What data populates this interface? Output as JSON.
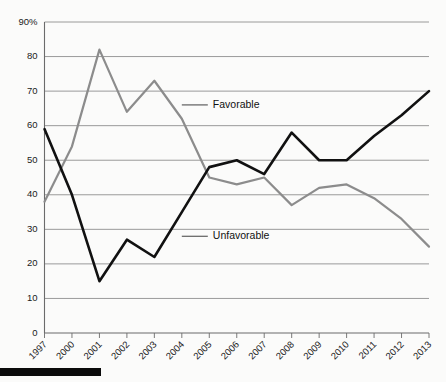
{
  "chart_data": {
    "type": "line",
    "title": "",
    "subtitle": "",
    "xlabel": "",
    "ylabel": "",
    "categories": [
      "1997",
      "2000",
      "2001",
      "2002",
      "2003",
      "2004",
      "2005",
      "2006",
      "2007",
      "2008",
      "2009",
      "2010",
      "2011",
      "2012",
      "2013"
    ],
    "series": [
      {
        "name": "Favorable",
        "color": "#8c8c8c",
        "values": [
          38,
          54,
          82,
          64,
          73,
          62,
          45,
          43,
          45,
          37,
          42,
          43,
          39,
          33,
          25
        ]
      },
      {
        "name": "Unfavorable",
        "color": "#111111",
        "values": [
          59,
          40,
          15,
          27,
          22,
          35,
          48,
          50,
          46,
          58,
          50,
          50,
          57,
          63,
          70
        ]
      }
    ],
    "ylim": [
      0,
      90
    ],
    "ytick_values": [
      0,
      10,
      20,
      30,
      40,
      50,
      60,
      70,
      80,
      90
    ],
    "ytick_labels": [
      "0",
      "10",
      "20",
      "30",
      "40",
      "50",
      "60",
      "70",
      "80",
      "90%"
    ],
    "grid": true,
    "grid_axis": "y",
    "legend": "inline-annotations",
    "legend_position": "none",
    "annotations": [
      {
        "text": "Favorable",
        "series": "Favorable",
        "x_category": "2004",
        "value": 66
      },
      {
        "text": "Unfavorable",
        "series": "Unfavorable",
        "x_category": "2004",
        "value": 28
      }
    ]
  },
  "footer": {
    "bar_color": "#0b0b0b"
  }
}
